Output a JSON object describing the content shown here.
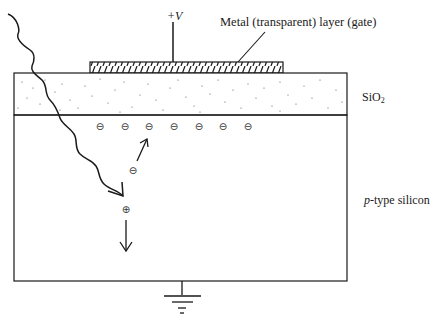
{
  "diagram": {
    "type": "MOS capacitor photodetector cross-section",
    "labels": {
      "voltage": "+V",
      "gate": "Metal (transparent) layer (gate)",
      "oxide_main": "SiO",
      "oxide_sub": "2",
      "substrate_italic": "p",
      "substrate_rest": "-type silicon"
    },
    "charges": {
      "inversion_layer_symbol": "⊖",
      "inversion_layer_count": 7,
      "electron_symbol": "⊖",
      "hole_symbol": "⊕"
    },
    "colors": {
      "line": "#1a1a1a",
      "background": "#ffffff"
    }
  }
}
